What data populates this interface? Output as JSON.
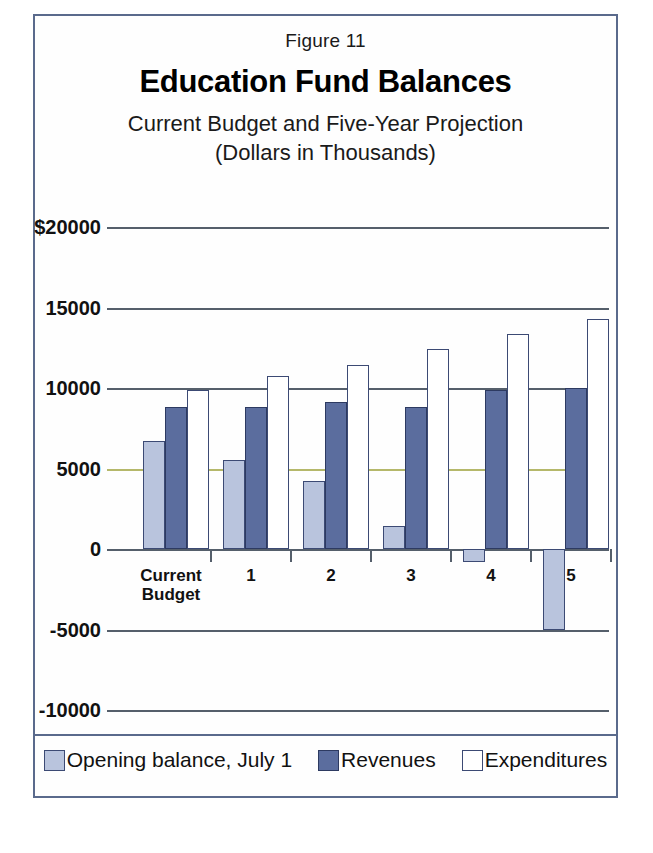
{
  "figure": {
    "number_label": "Figure 11",
    "title": "Education Fund Balances",
    "subtitle_line1": "Current Budget and Five-Year Projection",
    "subtitle_line2": "(Dollars in Thousands)"
  },
  "colors": {
    "opening_balance": "#b9c4dd",
    "revenues": "#5b6d9e",
    "expenditures": "#ffffff",
    "bar_outline": "#3c4a74",
    "gridline": "#555f6b",
    "gridline_highlight": "#b5b86a",
    "frame": "#5a6a8c"
  },
  "legend": {
    "items": [
      {
        "label": "Opening balance, July 1",
        "swatch": "opening"
      },
      {
        "label": "Revenues",
        "swatch": "revenues"
      },
      {
        "label": "Expenditures",
        "swatch": "expenditures"
      }
    ]
  },
  "axis": {
    "y_tick_labels": [
      "$20000",
      "15000",
      "10000",
      "5000",
      "0",
      "-5000",
      "-10000"
    ],
    "y_tick_values": [
      20000,
      15000,
      10000,
      5000,
      0,
      -5000,
      -10000
    ],
    "x_tick_labels": [
      "Current\nBudget",
      "1",
      "2",
      "3",
      "4",
      "5"
    ]
  },
  "chart_data": {
    "type": "bar",
    "title": "Education Fund Balances",
    "subtitle": "Current Budget and Five-Year Projection (Dollars in Thousands)",
    "xlabel": "",
    "ylabel": "",
    "ylim": [
      -10000,
      20000
    ],
    "ytick_values": [
      -10000,
      -5000,
      0,
      5000,
      10000,
      15000,
      20000
    ],
    "ytick_labels": [
      "-10000",
      "-5000",
      "0",
      "5000",
      "10000",
      "15000",
      "$20000"
    ],
    "grid": true,
    "legend_position": "bottom",
    "units": "Dollars in Thousands",
    "categories": [
      "Current Budget",
      "1",
      "2",
      "3",
      "4",
      "5"
    ],
    "series": [
      {
        "name": "Opening balance, July 1",
        "color": "#b9c4dd",
        "values": [
          6700,
          5500,
          4200,
          1400,
          -800,
          -5000
        ]
      },
      {
        "name": "Revenues",
        "color": "#5b6d9e",
        "values": [
          8800,
          8800,
          9100,
          8800,
          9850,
          10000
        ]
      },
      {
        "name": "Expenditures",
        "color": "#ffffff",
        "values": [
          9850,
          10750,
          11450,
          12400,
          13350,
          14300
        ]
      }
    ]
  }
}
